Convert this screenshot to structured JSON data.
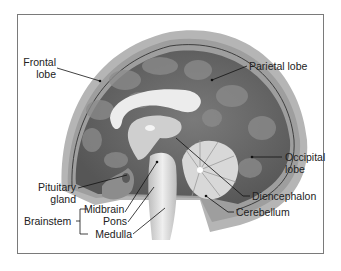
{
  "diagram": {
    "labels": {
      "frontal": [
        "Frontal",
        "lobe"
      ],
      "parietal": "Parietal lobe",
      "occipital": [
        "Occipital",
        "lobe"
      ],
      "pituitary": [
        "Pituitary",
        "gland"
      ],
      "brainstem": "Brainstem",
      "midbrain": "Midbrain",
      "pons": "Pons",
      "medulla": "Medulla",
      "diencephalon": "Diencephalon",
      "cerebellum": "Cerebellum"
    },
    "groups": [
      {
        "name": "Brainstem",
        "members": [
          "Midbrain",
          "Pons",
          "Medulla"
        ]
      }
    ],
    "colors": {
      "skull": "#b8b8b8",
      "cortex": "#6e6e6e",
      "gyri": "#8a8a8a",
      "white_matter": "#e8e8e8",
      "stem": "#d9d9d9",
      "border": "#7a7a7a",
      "leader": "#111111"
    }
  }
}
